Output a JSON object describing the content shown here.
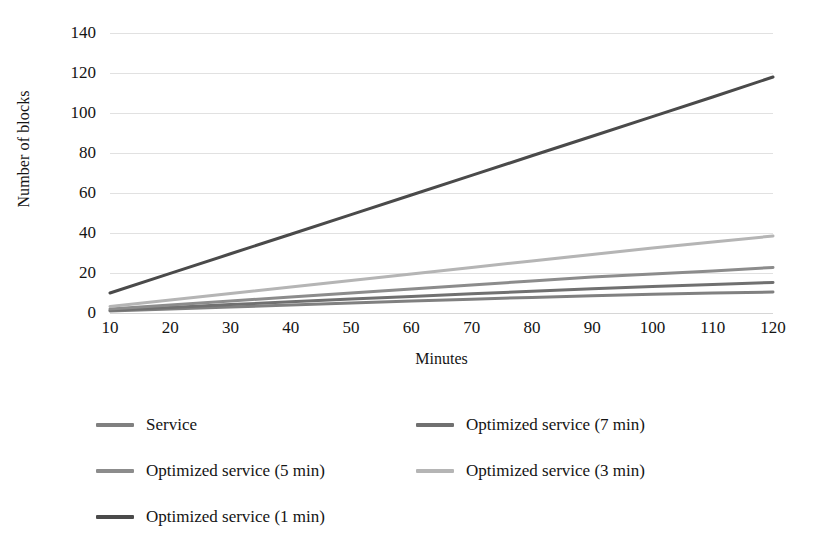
{
  "chart_data": {
    "type": "line",
    "title": "",
    "xlabel": "Minutes",
    "ylabel": "Number of blocks",
    "x": [
      10,
      20,
      30,
      40,
      50,
      60,
      70,
      80,
      90,
      100,
      110,
      120
    ],
    "xlim": [
      10,
      120
    ],
    "ylim": [
      0,
      140
    ],
    "xticks": [
      "10",
      "20",
      "30",
      "40",
      "50",
      "60",
      "70",
      "80",
      "90",
      "100",
      "110",
      "120"
    ],
    "yticks": [
      "0",
      "20",
      "40",
      "60",
      "80",
      "100",
      "120",
      "140"
    ],
    "grid": true,
    "legend_position": "bottom",
    "legend_columns": 2,
    "series": [
      {
        "name": "Service",
        "color": "#808080",
        "values": [
          1,
          2,
          3,
          4,
          5,
          6,
          6.9,
          7.8,
          8.6,
          9.4,
          10,
          10.5
        ]
      },
      {
        "name": "Optimized service (7 min)",
        "color": "#707070",
        "values": [
          1.4,
          2.8,
          4.2,
          5.6,
          7,
          8.3,
          9.6,
          10.9,
          12.1,
          13.3,
          14.3,
          15.3
        ]
      },
      {
        "name": "Optimized service (5 min)",
        "color": "#8c8c8c",
        "values": [
          2,
          4,
          6,
          8,
          10,
          12,
          14,
          16,
          18,
          19.5,
          21,
          22.8
        ]
      },
      {
        "name": "Optimized service (3 min)",
        "color": "#b5b5b5",
        "values": [
          3.3,
          6.5,
          9.8,
          13,
          16.3,
          19.5,
          22.8,
          26,
          29.3,
          32.5,
          35.5,
          38.5
        ]
      },
      {
        "name": "Optimized service (1 min)",
        "color": "#4a4a4a",
        "values": [
          10,
          19.8,
          29.6,
          39.4,
          49.2,
          59,
          68.8,
          78.6,
          88.4,
          98.2,
          108,
          118
        ]
      }
    ]
  },
  "legend": {
    "entries": [
      {
        "label": "Service",
        "color": "#808080",
        "col": 0,
        "row": 0
      },
      {
        "label": "Optimized service (7 min)",
        "color": "#707070",
        "col": 1,
        "row": 0
      },
      {
        "label": "Optimized service (5 min)",
        "color": "#8c8c8c",
        "col": 0,
        "row": 1
      },
      {
        "label": "Optimized service (3 min)",
        "color": "#b5b5b5",
        "col": 1,
        "row": 1
      },
      {
        "label": "Optimized service (1 min)",
        "color": "#4a4a4a",
        "col": 0,
        "row": 2
      }
    ]
  },
  "style": {
    "background": "#ffffff",
    "gridline_color": "#dcdcdc",
    "text_color": "#141414"
  }
}
